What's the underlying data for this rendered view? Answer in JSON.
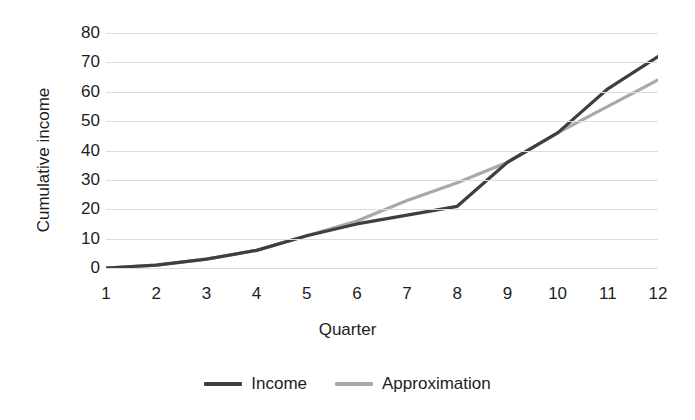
{
  "chart_data": {
    "type": "line",
    "title": "",
    "xlabel": "Quarter",
    "ylabel": "Cumulative income",
    "categories": [
      1,
      2,
      3,
      4,
      5,
      6,
      7,
      8,
      9,
      10,
      11,
      12
    ],
    "x": [
      1,
      2,
      3,
      4,
      5,
      6,
      7,
      8,
      9,
      10,
      11,
      12
    ],
    "xlim": [
      1,
      12
    ],
    "ylim": [
      0,
      80
    ],
    "y_ticks": [
      0,
      10,
      20,
      30,
      40,
      50,
      60,
      70,
      80
    ],
    "x_ticks": [
      1,
      2,
      3,
      4,
      5,
      6,
      7,
      8,
      9,
      10,
      11,
      12
    ],
    "grid": true,
    "legend_position": "bottom",
    "series": [
      {
        "name": "Income",
        "color": "#3f3f3f",
        "values": [
          0,
          1,
          3,
          6,
          11,
          15,
          18,
          21,
          36,
          46,
          61,
          72
        ]
      },
      {
        "name": "Approximation",
        "color": "#a9a9a9",
        "values": [
          0,
          1,
          3,
          6,
          11,
          16,
          23,
          29,
          36,
          46,
          55,
          64
        ]
      }
    ]
  },
  "axes": {
    "y_title": "Cumulative income",
    "x_title": "Quarter",
    "y_tick_labels": [
      "80",
      "70",
      "60",
      "50",
      "40",
      "30",
      "20",
      "10",
      "0"
    ],
    "x_tick_labels": [
      "1",
      "2",
      "3",
      "4",
      "5",
      "6",
      "7",
      "8",
      "9",
      "10",
      "11",
      "12"
    ]
  },
  "legend": {
    "items": [
      {
        "label": "Income",
        "color": "#3f3f3f"
      },
      {
        "label": "Approximation",
        "color": "#a9a9a9"
      }
    ]
  },
  "style": {
    "gridline_color": "#d9dde2",
    "background": "#ffffff",
    "text_color": "#1d1d1d"
  }
}
